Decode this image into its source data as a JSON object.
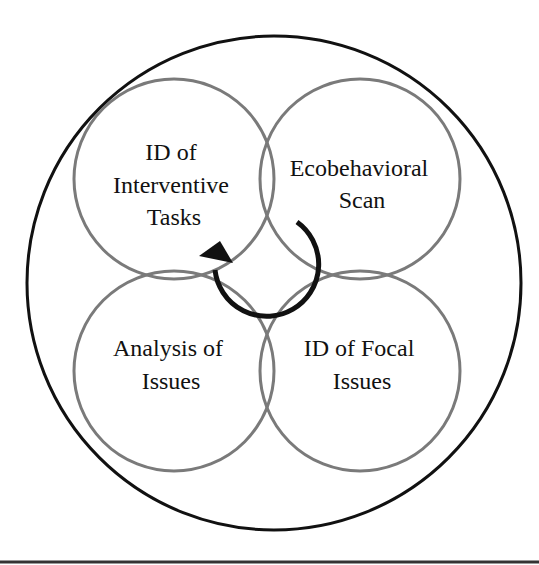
{
  "diagram": {
    "type": "cyclical-overlapping-circles",
    "outer_circle": {
      "cx": 274,
      "cy": 283,
      "r": 247,
      "stroke": "#111111"
    },
    "circles": [
      {
        "id": "top-left",
        "cx": 174,
        "cy": 179,
        "r": 100,
        "lines": [
          "ID of",
          "Interventive",
          "Tasks"
        ]
      },
      {
        "id": "top-right",
        "cx": 360,
        "cy": 179,
        "r": 100,
        "lines": [
          "Ecobehavioral",
          "Scan"
        ]
      },
      {
        "id": "bottom-left",
        "cx": 174,
        "cy": 371,
        "r": 100,
        "lines": [
          "Analysis of",
          "Issues"
        ]
      },
      {
        "id": "bottom-right",
        "cx": 360,
        "cy": 371,
        "r": 100,
        "lines": [
          "ID of Focal",
          "Issues"
        ]
      }
    ],
    "circle_stroke": "#7a7a7a",
    "arrow": {
      "direction": "clockwise-from-top-right-to-top-left",
      "color": "#111111"
    },
    "bottom_rule_color": "#333333"
  }
}
